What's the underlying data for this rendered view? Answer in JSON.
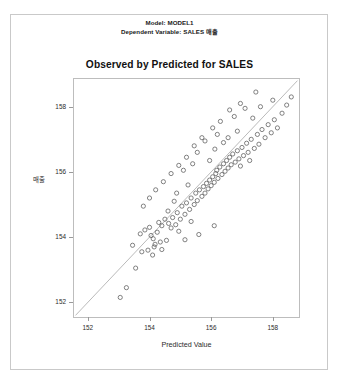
{
  "header": {
    "line1": "Model: MODEL1",
    "line2": "Dependent Variable: SALES 매출"
  },
  "chart_data": {
    "type": "scatter",
    "title": "Observed by Predicted for SALES",
    "xlabel": "Predicted Value",
    "ylabel": "매출",
    "xlim": [
      151.55,
      158.85
    ],
    "ylim": [
      151.55,
      158.85
    ],
    "xticks": [
      152,
      154,
      156,
      158
    ],
    "yticks": [
      152,
      154,
      156,
      158
    ],
    "xtick_labels": [
      "152",
      "154",
      "156",
      "158"
    ],
    "ytick_labels": [
      "152",
      "154",
      "156",
      "158"
    ],
    "grid": false,
    "legend": null,
    "marker": "open-circle",
    "marker_color": "#5a5a5a",
    "reference_line": {
      "type": "identity",
      "label": "y = x",
      "color": "#a8a8a8",
      "from": [
        151.6,
        151.6
      ],
      "to": [
        158.8,
        158.8
      ]
    },
    "points": [
      [
        153.05,
        152.15
      ],
      [
        153.25,
        152.45
      ],
      [
        153.55,
        153.05
      ],
      [
        153.75,
        153.55
      ],
      [
        153.45,
        153.75
      ],
      [
        153.95,
        153.6
      ],
      [
        154.1,
        153.45
      ],
      [
        154.15,
        153.7
      ],
      [
        154.18,
        153.78
      ],
      [
        153.7,
        154.1
      ],
      [
        153.85,
        154.22
      ],
      [
        154.0,
        154.3
      ],
      [
        154.05,
        154.05
      ],
      [
        154.12,
        153.95
      ],
      [
        154.25,
        154.15
      ],
      [
        154.35,
        153.85
      ],
      [
        154.4,
        154.35
      ],
      [
        154.55,
        153.9
      ],
      [
        154.3,
        154.45
      ],
      [
        154.5,
        154.55
      ],
      [
        154.62,
        154.42
      ],
      [
        154.7,
        154.28
      ],
      [
        154.75,
        154.6
      ],
      [
        154.85,
        154.38
      ],
      [
        154.9,
        154.75
      ],
      [
        155.0,
        154.55
      ],
      [
        155.05,
        154.95
      ],
      [
        155.15,
        154.7
      ],
      [
        155.2,
        155.05
      ],
      [
        155.3,
        154.85
      ],
      [
        155.35,
        155.2
      ],
      [
        155.45,
        155.0
      ],
      [
        155.5,
        155.35
      ],
      [
        155.55,
        155.12
      ],
      [
        155.62,
        155.45
      ],
      [
        155.7,
        155.25
      ],
      [
        155.75,
        155.55
      ],
      [
        155.8,
        155.35
      ],
      [
        155.85,
        155.65
      ],
      [
        155.9,
        155.48
      ],
      [
        155.95,
        155.75
      ],
      [
        156.0,
        155.58
      ],
      [
        156.05,
        155.85
      ],
      [
        156.1,
        155.68
      ],
      [
        156.15,
        155.95
      ],
      [
        156.18,
        156.05
      ],
      [
        156.22,
        155.8
      ],
      [
        156.28,
        156.15
      ],
      [
        156.35,
        155.92
      ],
      [
        156.4,
        156.25
      ],
      [
        156.45,
        156.02
      ],
      [
        156.5,
        156.35
      ],
      [
        156.55,
        156.12
      ],
      [
        156.6,
        156.45
      ],
      [
        156.65,
        156.22
      ],
      [
        156.7,
        156.55
      ],
      [
        156.78,
        156.3
      ],
      [
        156.85,
        156.65
      ],
      [
        156.9,
        156.4
      ],
      [
        157.0,
        156.75
      ],
      [
        157.05,
        156.5
      ],
      [
        157.15,
        156.88
      ],
      [
        157.2,
        156.6
      ],
      [
        157.3,
        157.0
      ],
      [
        157.4,
        156.72
      ],
      [
        157.5,
        157.15
      ],
      [
        157.55,
        156.85
      ],
      [
        157.65,
        157.3
      ],
      [
        157.75,
        157.05
      ],
      [
        157.85,
        157.45
      ],
      [
        157.95,
        157.2
      ],
      [
        158.05,
        157.6
      ],
      [
        158.15,
        157.35
      ],
      [
        158.3,
        157.8
      ],
      [
        158.45,
        158.05
      ],
      [
        158.6,
        158.3
      ],
      [
        157.45,
        158.45
      ],
      [
        156.95,
        158.1
      ],
      [
        156.6,
        157.9
      ],
      [
        156.3,
        157.55
      ],
      [
        156.05,
        157.35
      ],
      [
        155.7,
        157.05
      ],
      [
        155.45,
        156.8
      ],
      [
        155.2,
        156.45
      ],
      [
        154.95,
        156.2
      ],
      [
        154.7,
        155.95
      ],
      [
        154.45,
        155.7
      ],
      [
        154.2,
        155.45
      ],
      [
        154.0,
        155.2
      ],
      [
        153.8,
        154.95
      ],
      [
        155.8,
        156.95
      ],
      [
        156.2,
        157.15
      ],
      [
        156.75,
        157.7
      ],
      [
        157.1,
        157.95
      ],
      [
        155.55,
        156.6
      ],
      [
        155.1,
        156.05
      ],
      [
        156.4,
        156.9
      ],
      [
        156.85,
        157.25
      ],
      [
        157.35,
        157.65
      ],
      [
        154.6,
        154.8
      ],
      [
        154.8,
        155.1
      ],
      [
        155.25,
        155.6
      ],
      [
        155.95,
        156.35
      ],
      [
        156.55,
        157.05
      ],
      [
        157.6,
        158.0
      ],
      [
        158.0,
        158.2
      ],
      [
        155.4,
        156.25
      ],
      [
        154.88,
        155.35
      ],
      [
        156.12,
        156.7
      ],
      [
        156.95,
        156.18
      ],
      [
        157.25,
        156.35
      ],
      [
        155.15,
        153.92
      ],
      [
        155.6,
        154.08
      ],
      [
        156.1,
        154.35
      ],
      [
        154.95,
        154.18
      ],
      [
        155.35,
        154.48
      ],
      [
        154.4,
        153.62
      ]
    ]
  }
}
